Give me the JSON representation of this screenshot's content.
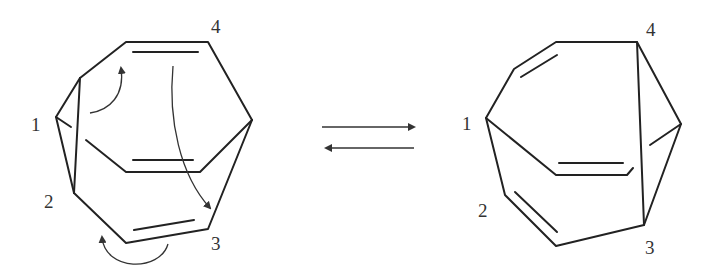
{
  "diagram": {
    "type": "chemical-equilibrium",
    "left_structure": {
      "labels": [
        "1",
        "2",
        "3",
        "4"
      ],
      "curved_arrows": 3
    },
    "equilibrium_arrow": "forward-reverse",
    "right_structure": {
      "labels": [
        "1",
        "2",
        "3",
        "4"
      ]
    },
    "colors": {
      "stroke": "#222222",
      "background": "#ffffff"
    }
  }
}
